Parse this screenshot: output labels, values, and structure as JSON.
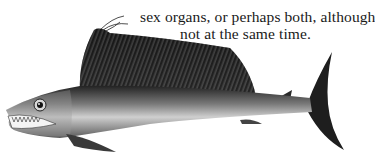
{
  "page": {
    "text_lines": [
      "either male or female",
      "sex organs, or perhaps both, although",
      "not at the same time."
    ]
  },
  "illustration": {
    "subject": "lancetfish",
    "description": "Engraved illustration of a long slender fish with a tall ridged dorsal fin, large eye, open jaw with sharp teeth, and forked tail",
    "colors": {
      "dark": "#1c1c1c",
      "mid": "#6e6e6e",
      "light": "#c8c8c8",
      "background": "#ffffff"
    }
  }
}
